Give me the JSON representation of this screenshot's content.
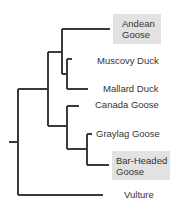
{
  "diagram": {
    "type": "phylogenetic-tree",
    "highlight_color": "#e2e2e2",
    "line_color": "#3a3a3a",
    "taxa": [
      {
        "id": "andean",
        "line1": "Andean",
        "line2": "Goose",
        "highlighted": true
      },
      {
        "id": "muscovy",
        "line1": "Muscovy Duck",
        "highlighted": false
      },
      {
        "id": "mallard",
        "line1": "Mallard Duck",
        "highlighted": false
      },
      {
        "id": "canada",
        "line1": "Canada Goose",
        "highlighted": false
      },
      {
        "id": "graylag",
        "line1": "Graylag Goose",
        "highlighted": false
      },
      {
        "id": "barheaded",
        "line1": "Bar-Headed",
        "line2": "Goose",
        "highlighted": true
      },
      {
        "id": "vulture",
        "line1": "Vulture",
        "highlighted": false
      }
    ]
  }
}
